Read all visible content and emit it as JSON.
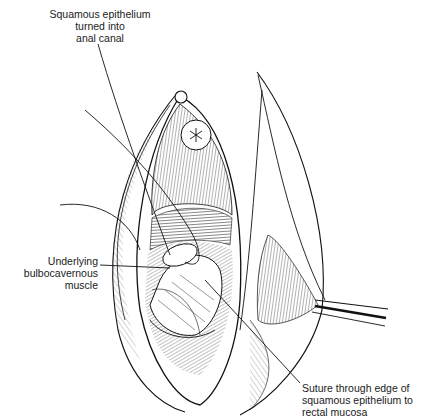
{
  "figure": {
    "background": "#ffffff",
    "ink": "#111111"
  },
  "labels": [
    {
      "id": "top",
      "lines": [
        "Squamous epithelium",
        "turned into",
        "anal canal"
      ]
    },
    {
      "id": "left",
      "lines": [
        "Underlying",
        "bulbocavernous",
        "muscle"
      ]
    },
    {
      "id": "bottom",
      "lines": [
        "Suture through edge of",
        "squamous epithelium to",
        "rectal mucosa"
      ]
    }
  ]
}
